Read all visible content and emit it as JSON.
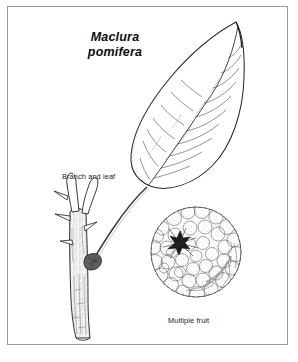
{
  "plate": {
    "width": 298,
    "height": 362,
    "background_color": "#ffffff",
    "border_color": "#9a9a9a",
    "ink_color": "#1c1c1c"
  },
  "title": {
    "line1": "Maclura",
    "line2": "pomifera",
    "style": "bold-italic"
  },
  "captions": {
    "branch": "Branch and leaf",
    "fruit": "Multiple fruit"
  },
  "figures": {
    "leaf": {
      "name": "leaf",
      "description": "ovate acuminate leaf with pinnate venation and stippled shading"
    },
    "branch": {
      "name": "branch",
      "description": "woody twig with thorns and leaf node"
    },
    "fruit": {
      "name": "multiple-fruit",
      "description": "globular bumpy osage orange fruit with stem scar"
    }
  }
}
